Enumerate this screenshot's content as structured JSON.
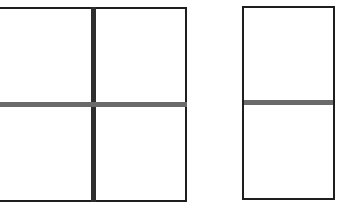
{
  "diagram": {
    "colors": {
      "background": "#ffffff",
      "outline": "#1e1e1e",
      "vertical_divider": "#2e2e2e",
      "horizontal_divider": "#6a6a6a"
    },
    "shapes": [
      {
        "id": "left-grid",
        "type": "rectangle",
        "divisions": "2x2",
        "cells": 4
      },
      {
        "id": "right-grid",
        "type": "rectangle",
        "divisions": "1x2",
        "cells": 2
      }
    ]
  }
}
